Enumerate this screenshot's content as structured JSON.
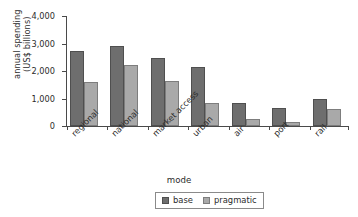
{
  "chart_data": {
    "type": "bar",
    "title": "",
    "xlabel": "mode",
    "ylabel": "annual spending\n(US$ billions)",
    "ylabel_line1": "annual spending",
    "ylabel_line2": "(US$ billions)",
    "categories": [
      "regional",
      "national",
      "market access",
      "urban",
      "air",
      "port",
      "rail"
    ],
    "series": [
      {
        "name": "base",
        "color": "#6e6e6e",
        "values": [
          2720,
          2900,
          2480,
          2150,
          850,
          670,
          1000
        ]
      },
      {
        "name": "pragmatic",
        "color": "#a9a9a9",
        "values": [
          1600,
          2220,
          1630,
          840,
          270,
          130,
          620
        ]
      }
    ],
    "ylim": [
      0,
      4000
    ],
    "yticks": [
      0,
      1000,
      2000,
      3000,
      4000
    ],
    "ytick_labels": [
      "0",
      "1,000",
      "2,000",
      "3,000",
      "4,000"
    ],
    "grid": false,
    "legend_position": "bottom-center"
  },
  "legend": {
    "entries": [
      {
        "label": "base",
        "swatch": "dark-gray-swatch"
      },
      {
        "label": "pragmatic",
        "swatch": "light-gray-swatch"
      }
    ]
  }
}
